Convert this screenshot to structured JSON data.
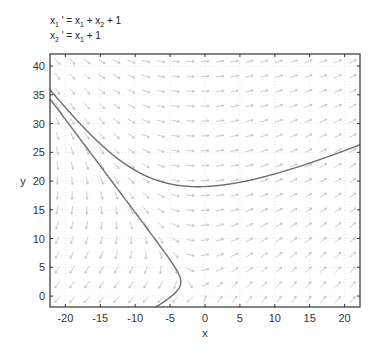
{
  "chart_data": {
    "type": "line",
    "title_lines": [
      {
        "text": "x1 ' = x1 + x2 + 1",
        "parts": [
          [
            "x",
            "n"
          ],
          [
            "1",
            "s"
          ],
          [
            " ' = x",
            "n"
          ],
          [
            "1",
            "s"
          ],
          [
            " + x",
            "n"
          ],
          [
            "2",
            "s"
          ],
          [
            " + 1",
            "n"
          ]
        ]
      },
      {
        "text": "x2 ' = x1 + 1",
        "parts": [
          [
            "x",
            "n"
          ],
          [
            "2",
            "s"
          ],
          [
            " ' = x",
            "n"
          ],
          [
            "1",
            "s"
          ],
          [
            " + 1",
            "n"
          ]
        ]
      }
    ],
    "xlabel": "x",
    "ylabel": "y",
    "xlim": [
      -22.2,
      22.2
    ],
    "ylim": [
      -1.9,
      42.1
    ],
    "xticks": [
      -20,
      -15,
      -10,
      -5,
      0,
      5,
      10,
      15,
      20
    ],
    "yticks": [
      0,
      5,
      10,
      15,
      20,
      25,
      30,
      35,
      40
    ],
    "grid": true,
    "vector_field": {
      "dx": "x + y + 1",
      "dy": "x + 1",
      "nx": 21,
      "ny": 17
    },
    "series": [
      {
        "name": "solution-upper",
        "start": [
          -22.2,
          35.9
        ],
        "approx_min": [
          -1,
          19.5
        ],
        "end_y": 26.5
      },
      {
        "name": "solution-lower",
        "start": [
          -22.2,
          34.3
        ],
        "approx_min": [
          -2,
          7.5
        ],
        "end_y": 17.5
      }
    ],
    "colors": {
      "curve": "#6e6e6e",
      "arrow": "#b8b8b8",
      "grid": "#d8d8d8",
      "axis": "#333333"
    }
  }
}
